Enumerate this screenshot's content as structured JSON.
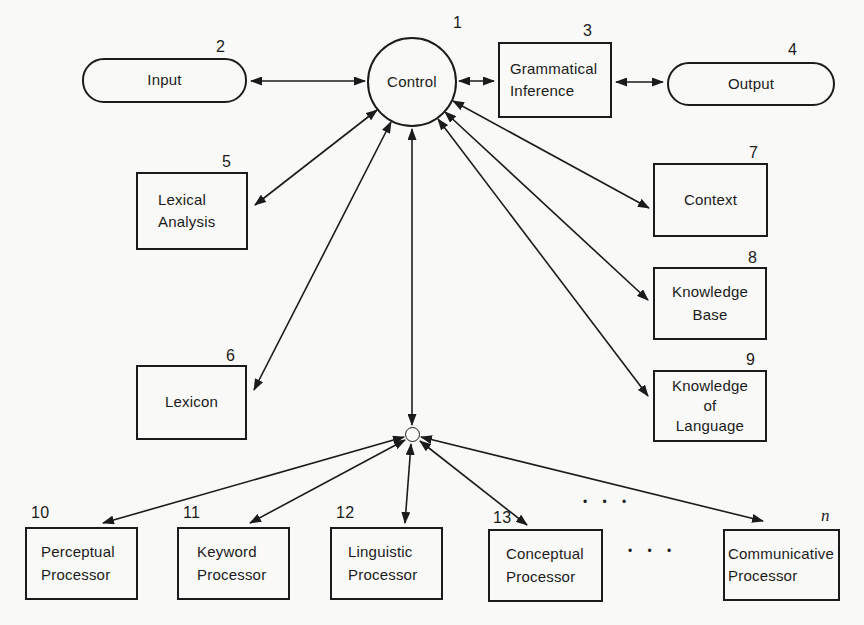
{
  "diagram": {
    "nodes": {
      "control": {
        "number": "1",
        "lines": [
          "Control"
        ]
      },
      "input": {
        "number": "2",
        "lines": [
          "Input"
        ]
      },
      "grammatical_inference": {
        "number": "3",
        "lines": [
          "Grammatical",
          "Inference"
        ]
      },
      "output": {
        "number": "4",
        "lines": [
          "Output"
        ]
      },
      "lexical_analysis": {
        "number": "5",
        "lines": [
          "Lexical",
          "Analysis"
        ]
      },
      "lexicon": {
        "number": "6",
        "lines": [
          "Lexicon"
        ]
      },
      "context": {
        "number": "7",
        "lines": [
          "Context"
        ]
      },
      "knowledge_base": {
        "number": "8",
        "lines": [
          "Knowledge",
          "Base"
        ]
      },
      "knowledge_of_language": {
        "number": "9",
        "lines": [
          "Knowledge",
          "of",
          "Language"
        ]
      },
      "perceptual_processor": {
        "number": "10",
        "lines": [
          "Perceptual",
          "Processor"
        ]
      },
      "keyword_processor": {
        "number": "11",
        "lines": [
          "Keyword",
          "Processor"
        ]
      },
      "linguistic_processor": {
        "number": "12",
        "lines": [
          "Linguistic",
          "Processor"
        ]
      },
      "conceptual_processor": {
        "number": "13",
        "lines": [
          "Conceptual",
          "Processor"
        ]
      },
      "communicative_processor": {
        "number": "n",
        "lines": [
          "Communicative",
          "Processor"
        ]
      }
    },
    "ellipses": {
      "upper": "•  •  •",
      "middle": "•  •  •"
    },
    "edges": [
      {
        "from": "input",
        "to": "control",
        "style": "bidirectional"
      },
      {
        "from": "control",
        "to": "grammatical_inference",
        "style": "bidirectional"
      },
      {
        "from": "grammatical_inference",
        "to": "output",
        "style": "bidirectional"
      },
      {
        "from": "control",
        "to": "lexical_analysis",
        "style": "bidirectional"
      },
      {
        "from": "control",
        "to": "lexicon",
        "style": "bidirectional"
      },
      {
        "from": "control",
        "to": "hub",
        "style": "bidirectional"
      },
      {
        "from": "control",
        "to": "context",
        "style": "bidirectional"
      },
      {
        "from": "control",
        "to": "knowledge_base",
        "style": "bidirectional"
      },
      {
        "from": "control",
        "to": "knowledge_of_language",
        "style": "bidirectional"
      },
      {
        "from": "hub",
        "to": "perceptual_processor",
        "style": "bidirectional"
      },
      {
        "from": "hub",
        "to": "keyword_processor",
        "style": "bidirectional"
      },
      {
        "from": "hub",
        "to": "linguistic_processor",
        "style": "bidirectional"
      },
      {
        "from": "hub",
        "to": "conceptual_processor",
        "style": "bidirectional"
      },
      {
        "from": "hub",
        "to": "communicative_processor",
        "style": "bidirectional"
      }
    ],
    "colors": {
      "ink": "#1b1b1b",
      "paper": "#f9f9f7"
    }
  }
}
